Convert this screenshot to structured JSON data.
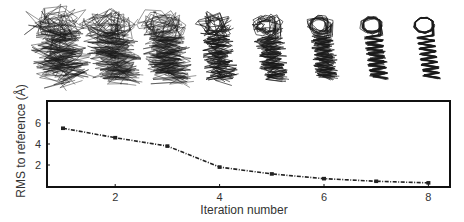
{
  "chart_data": {
    "type": "line",
    "title": "",
    "xlabel": "Iteration number",
    "ylabel": "RMS to reference (Å)",
    "x": [
      1,
      2,
      3,
      4,
      5,
      6,
      7,
      8
    ],
    "series": [
      {
        "name": "RMS to reference",
        "values": [
          5.5,
          4.6,
          3.8,
          1.8,
          1.15,
          0.7,
          0.45,
          0.3
        ],
        "style": "dash-dot",
        "marker": "square",
        "color": "#222222"
      }
    ],
    "xticks": [
      2,
      4,
      6,
      8
    ],
    "yticks": [
      2,
      4,
      6
    ],
    "xlim": [
      0.7,
      8.4
    ],
    "ylim": [
      0,
      8.1
    ],
    "grid": false,
    "legend": null,
    "annotations": [
      {
        "type": "image-strip",
        "description": "Superimposed protein backbone ensembles above each iteration, converging from diffuse to tight bundles",
        "count": 8
      }
    ]
  },
  "figure": {
    "structures_label": "protein-ensemble-strip",
    "structure_count": 8
  }
}
